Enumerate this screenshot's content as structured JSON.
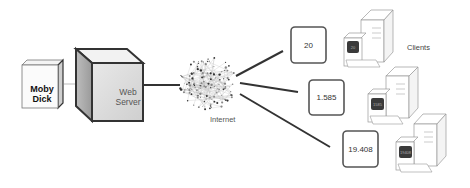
{
  "diagram": {
    "book": {
      "title_line1": "Moby",
      "title_line2": "Dick"
    },
    "server": {
      "title_line1": "Web",
      "title_line2": "Server"
    },
    "network": {
      "label": "Internet"
    },
    "clients_label": "Clients",
    "clients": [
      {
        "count": "20",
        "screen": "20"
      },
      {
        "count": "1.585",
        "screen": "1585"
      },
      {
        "count": "19.408",
        "screen": "19408"
      }
    ]
  },
  "colors": {
    "stroke_dark": "#333333",
    "screen_fill": "#3a3a3a",
    "box_face": "#d9d9d9",
    "box_top": "#ececec"
  }
}
